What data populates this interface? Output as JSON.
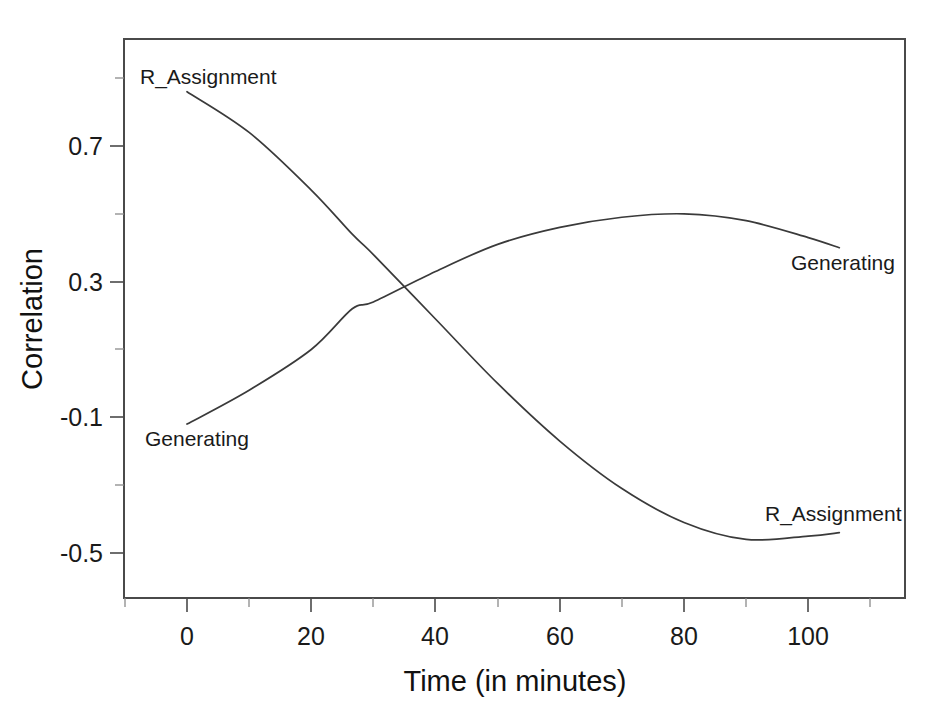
{
  "chart_data": {
    "type": "line",
    "title": "",
    "xlabel": "Time (in minutes)",
    "ylabel": "Correlation",
    "xlim": [
      -10,
      116
    ],
    "ylim": [
      -0.63,
      0.96
    ],
    "grid": false,
    "legend": "inline-end-labels",
    "x_ticks_major": [
      0,
      20,
      40,
      60,
      80,
      100
    ],
    "x_tick_labels": [
      "0",
      "20",
      "40",
      "60",
      "80",
      "100"
    ],
    "x_ticks_minor": [
      -10,
      10,
      30,
      50,
      70,
      90,
      110
    ],
    "y_ticks_major": [
      0.7,
      0.3,
      -0.1,
      -0.5
    ],
    "y_tick_labels": [
      "0.7",
      "0.3",
      "-0.1",
      "-0.5"
    ],
    "y_ticks_minor": [
      0.9,
      0.5,
      0.1,
      -0.3
    ],
    "series": [
      {
        "name": "R_Assignment",
        "label_start": "R_Assignment",
        "label_end": "R_Assignment",
        "x": [
          0,
          10,
          20,
          26.6,
          30,
          40,
          50,
          60,
          70,
          80,
          90,
          100,
          105
        ],
        "values": [
          0.86,
          0.74,
          0.57,
          0.44,
          0.38,
          0.19,
          0.0,
          -0.17,
          -0.31,
          -0.41,
          -0.46,
          -0.45,
          -0.44
        ]
      },
      {
        "name": "Generating",
        "label_start": "Generating",
        "label_end": "Generating",
        "x": [
          0,
          10,
          20,
          26.6,
          30,
          40,
          50,
          60,
          70,
          80,
          90,
          100,
          105
        ],
        "values": [
          -0.12,
          -0.02,
          0.1,
          0.22,
          0.24,
          0.33,
          0.41,
          0.46,
          0.49,
          0.5,
          0.48,
          0.43,
          0.4
        ]
      }
    ],
    "annotations": [
      {
        "text": "R_Assignment",
        "x": 0,
        "y": 0.93,
        "anchor": "start",
        "role": "series-label-left-upper"
      },
      {
        "text": "Generating",
        "x": 0,
        "y": -0.17,
        "anchor": "start",
        "role": "series-label-left-lower"
      },
      {
        "text": "Generating",
        "x": 101,
        "y": 0.34,
        "anchor": "start",
        "role": "series-label-right-upper"
      },
      {
        "text": "R_Assignment",
        "x": 95,
        "y": -0.38,
        "anchor": "start",
        "role": "series-label-right-lower"
      }
    ],
    "colors": {
      "line": "#3a3a3a",
      "axis": "#4a4a4a",
      "text": "#1a1a1a",
      "background": "#ffffff"
    }
  }
}
